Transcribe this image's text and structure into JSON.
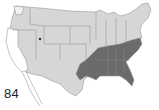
{
  "figure": {
    "label": "84",
    "type": "us-range-map",
    "colors": {
      "background": "#ffffff",
      "unshaded_state": "#d6d6d6",
      "shaded_state": "#6b6b6b",
      "border": "#8a8a8a",
      "excluded": "#ffffff"
    },
    "shaded_regions": [
      "Texas (east)",
      "Oklahoma (east)",
      "Arkansas",
      "Louisiana",
      "Mississippi",
      "Alabama",
      "Georgia",
      "Florida",
      "South Carolina",
      "North Carolina",
      "Tennessee",
      "Virginia (south-east)"
    ],
    "unshaded_regions": [
      "California",
      "Washington (partial)",
      "Baja California (outline)"
    ],
    "marker": {
      "location": "Utah",
      "icon": "dot-marker"
    }
  }
}
